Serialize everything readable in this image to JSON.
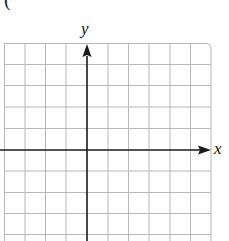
{
  "figure": {
    "partial_glyph": "(",
    "axes": {
      "x_label": "x",
      "y_label": "y"
    },
    "grid": {
      "columns": 10,
      "visible_rows": 9,
      "line_color": "#b8b8b8",
      "axis_color": "#1a1a1a",
      "background": "#ffffff"
    }
  }
}
